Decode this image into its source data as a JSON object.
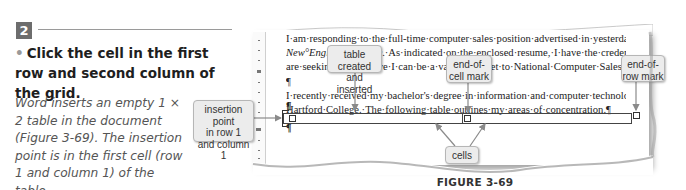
{
  "step": {
    "number": "2",
    "instruction_bullet": "•",
    "instruction": "Click the cell in the first row and second column of the grid.",
    "explanation": "Word inserts an empty 1 × 2 table in the document (Figure 3-69). The insertion point is in the first cell (row 1 and column 1) of the table."
  },
  "document": {
    "lines": [
      {
        "text": "I·am·responding·to·the·full-time·computer·sales·position·advertised·in·yesterday's·"
      },
      {
        "italic": "New°England°Tribune",
        "text": ".·As·indicated·on·the·enclosed·resume,·I·have·the·credentials·you·"
      },
      {
        "text": "are·seeking·and·believe·I·can·be·a·valuable·asset·to·National·Computer·Sales.¶"
      },
      {
        "text": "¶"
      },
      {
        "text": "I·recently·received·my·bachelor's·degree·in·information·and·computer·technology·from·"
      },
      {
        "text": "Hartford·College.·The·following·table·outlines·my·areas·of·concentration.¶"
      }
    ],
    "pilcrow": "¶",
    "table": {
      "rows": 1,
      "columns": 2
    }
  },
  "callouts": {
    "insertion_point": "insertion point in row 1 and column 1",
    "insertion_point_lines": [
      "insertion point",
      "in row 1",
      "and column 1"
    ],
    "table_created": [
      "table created",
      "and inserted"
    ],
    "end_of_cell": [
      "end-of-",
      "cell mark"
    ],
    "end_of_row": [
      "end-of-",
      "row mark"
    ],
    "cells": "cells"
  },
  "figure": {
    "caption": "FIGURE 3-69"
  },
  "colors": {
    "step_badge": "#6d6d6d",
    "callout_bg": "#ececec",
    "arrow": "#8a8a8a"
  }
}
